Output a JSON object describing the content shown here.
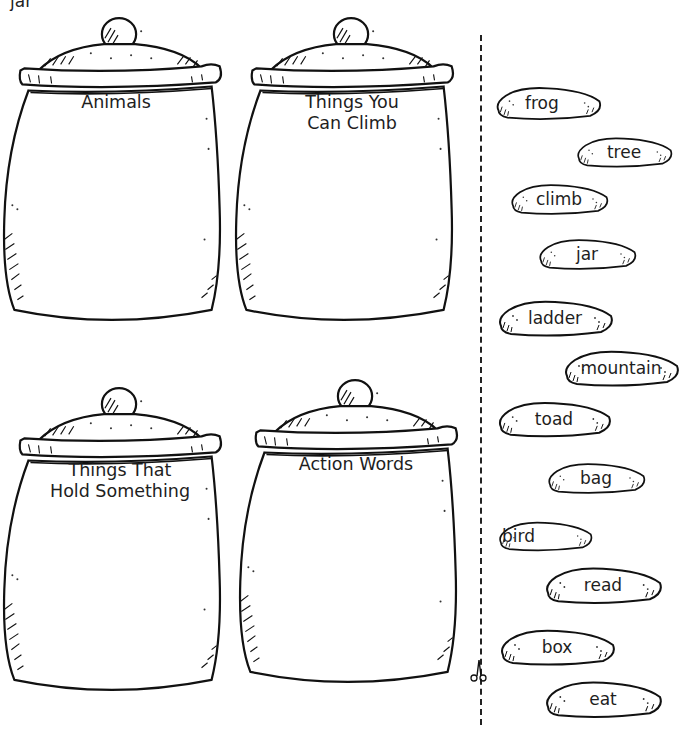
{
  "page": {
    "top_fragment": "jar"
  },
  "jars": [
    {
      "id": "animals",
      "label_lines": [
        "Animals"
      ]
    },
    {
      "id": "things-you-can-climb",
      "label_lines": [
        "Things You",
        "Can Climb"
      ]
    },
    {
      "id": "things-that-hold-something",
      "label_lines": [
        "Things That",
        "Hold Something"
      ]
    },
    {
      "id": "action-words",
      "label_lines": [
        "Action Words"
      ]
    }
  ],
  "cut_line": {
    "icon": "scissors-icon"
  },
  "word_cards": [
    {
      "word": "frog"
    },
    {
      "word": "tree"
    },
    {
      "word": "climb"
    },
    {
      "word": "jar"
    },
    {
      "word": "ladder"
    },
    {
      "word": "mountain"
    },
    {
      "word": "toad"
    },
    {
      "word": "bag"
    },
    {
      "word": "bird"
    },
    {
      "word": "read"
    },
    {
      "word": "box"
    },
    {
      "word": "eat"
    }
  ]
}
